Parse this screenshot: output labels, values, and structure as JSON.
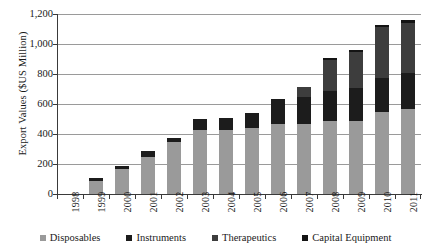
{
  "chart_data": {
    "type": "bar",
    "subtype": "stacked-column",
    "title": "",
    "xlabel": "",
    "ylabel": "Export Values ($US Million)",
    "ylim": [
      0,
      1200
    ],
    "ytick_labels": [
      "0",
      "200",
      "400",
      "600",
      "800",
      "1,000",
      "1,200"
    ],
    "ytick_values": [
      0,
      200,
      400,
      600,
      800,
      1000,
      1200
    ],
    "grid": true,
    "legend_position": "bottom",
    "categories": [
      "1998",
      "1999",
      "2000",
      "2001",
      "2002",
      "2003",
      "2004",
      "2005",
      "2006",
      "2007",
      "2008",
      "2009",
      "2010",
      "2011"
    ],
    "series": [
      {
        "name": "Disposables",
        "color": "#9a9a9a",
        "values": [
          0,
          85,
          170,
          250,
          345,
          430,
          430,
          440,
          470,
          470,
          485,
          490,
          545,
          570
        ]
      },
      {
        "name": "Instruments",
        "color": "#1c1c1c",
        "values": [
          0,
          20,
          20,
          35,
          30,
          70,
          80,
          100,
          165,
          180,
          200,
          215,
          230,
          240
        ]
      },
      {
        "name": "Therapeutics",
        "color": "#3d3d3d",
        "values": [
          0,
          0,
          0,
          0,
          0,
          0,
          0,
          0,
          0,
          65,
          210,
          240,
          340,
          330
        ]
      },
      {
        "name": "Capital Equipment",
        "color": "#141414",
        "values": [
          0,
          0,
          0,
          0,
          0,
          0,
          0,
          0,
          0,
          0,
          10,
          15,
          15,
          20
        ]
      }
    ],
    "totals": [
      0,
      105,
      190,
      285,
      375,
      500,
      510,
      540,
      635,
      715,
      905,
      960,
      1130,
      1160
    ]
  },
  "legend": {
    "items": [
      {
        "label": "Disposables",
        "color": "#9a9a9a"
      },
      {
        "label": "Instruments",
        "color": "#1c1c1c"
      },
      {
        "label": "Therapeutics",
        "color": "#3d3d3d"
      },
      {
        "label": "Capital Equipment",
        "color": "#141414"
      }
    ]
  }
}
